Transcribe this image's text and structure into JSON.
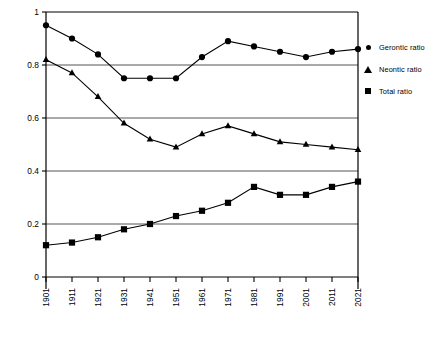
{
  "chart_data": {
    "type": "line",
    "title": "",
    "xlabel": "",
    "ylabel": "",
    "x": [
      1901,
      1911,
      1921,
      1931,
      1941,
      1951,
      1961,
      1971,
      1981,
      1991,
      2001,
      2011,
      2021
    ],
    "categories": [
      "1901",
      "1911",
      "1921",
      "1931",
      "1941",
      "1951",
      "1961",
      "1971",
      "1981",
      "1991",
      "2001",
      "2011",
      "2021"
    ],
    "series": [
      {
        "name": "Gerontic ratio",
        "marker": "circle",
        "values": [
          0.95,
          0.9,
          0.84,
          0.75,
          0.75,
          0.75,
          0.83,
          0.89,
          0.87,
          0.85,
          0.83,
          0.85,
          0.86
        ]
      },
      {
        "name": "Neontic ratio",
        "marker": "triangle",
        "values": [
          0.82,
          0.77,
          0.68,
          0.58,
          0.52,
          0.49,
          0.54,
          0.57,
          0.54,
          0.51,
          0.5,
          0.49,
          0.48
        ]
      },
      {
        "name": "Total ratio",
        "marker": "square",
        "values": [
          0.12,
          0.13,
          0.15,
          0.18,
          0.2,
          0.23,
          0.25,
          0.28,
          0.34,
          0.31,
          0.31,
          0.34,
          0.36
        ]
      }
    ],
    "ylim": [
      0,
      1
    ],
    "yticks": [
      0,
      0.2,
      0.4,
      0.6,
      0.8,
      1
    ],
    "ytick_labels": [
      "0",
      "0.2",
      "0.4",
      "0.6",
      "0.8",
      "1"
    ],
    "grid": true,
    "grid_axis": "y",
    "legend_position": "right",
    "colors": {
      "series": "#000000",
      "grid": "#555555",
      "axis": "#000000",
      "background": "#ffffff"
    }
  },
  "legend": {
    "items": [
      {
        "label": "Gerontic ratio",
        "marker": "circle-marker"
      },
      {
        "label": "Neontic ratio",
        "marker": "triangle-marker"
      },
      {
        "label": "Total ratio",
        "marker": "square-marker"
      }
    ]
  },
  "caption": {
    "text": ""
  }
}
